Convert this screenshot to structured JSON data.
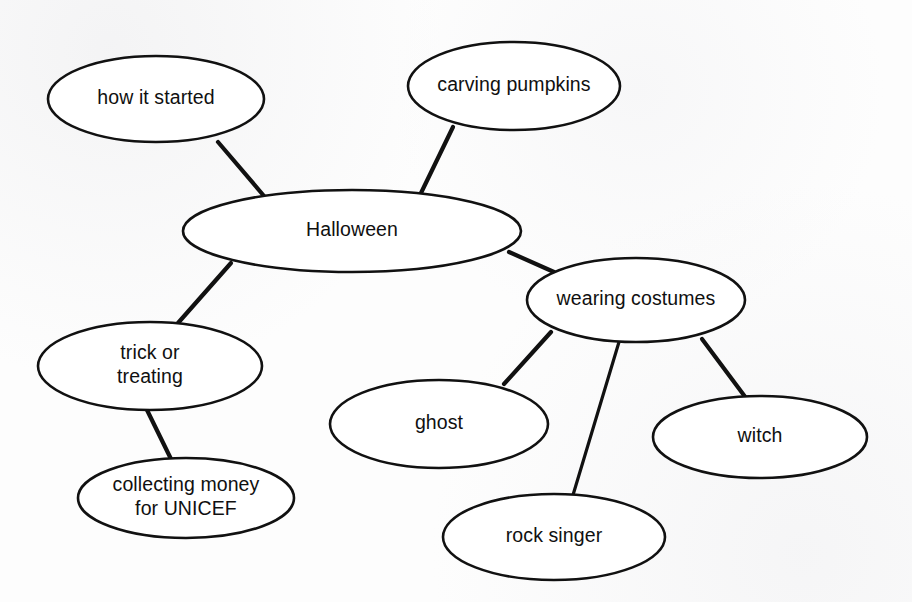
{
  "diagram": {
    "title": "Halloween",
    "type": "mind-map",
    "background_color": "#fdfdfd",
    "ink_color": "#111111",
    "nodes": [
      {
        "id": "halloween",
        "label": "Halloween",
        "lines": [
          "Halloween"
        ],
        "cx": 352,
        "cy": 231,
        "rx": 169,
        "ry": 41,
        "level": 0
      },
      {
        "id": "how-it-started",
        "label": "how it started",
        "lines": [
          "how it started"
        ],
        "cx": 156,
        "cy": 99,
        "rx": 108,
        "ry": 43,
        "level": 1
      },
      {
        "id": "carving-pumpkins",
        "label": "carving pumpkins",
        "lines": [
          "carving pumpkins"
        ],
        "cx": 514,
        "cy": 86,
        "rx": 106,
        "ry": 44,
        "level": 1
      },
      {
        "id": "trick-or-treating",
        "label": "trick or treating",
        "lines": [
          "trick or",
          "treating"
        ],
        "cx": 150,
        "cy": 366,
        "rx": 112,
        "ry": 44,
        "level": 1
      },
      {
        "id": "wearing-costumes",
        "label": "wearing costumes",
        "lines": [
          "wearing costumes"
        ],
        "cx": 636,
        "cy": 300,
        "rx": 109,
        "ry": 42,
        "level": 1
      },
      {
        "id": "collecting-money-for-unicef",
        "label": "collecting money for UNICEF",
        "lines": [
          "collecting money",
          "for UNICEF"
        ],
        "cx": 186,
        "cy": 498,
        "rx": 108,
        "ry": 40,
        "level": 2
      },
      {
        "id": "ghost",
        "label": "ghost",
        "lines": [
          "ghost"
        ],
        "cx": 439,
        "cy": 424,
        "rx": 109,
        "ry": 44,
        "level": 2
      },
      {
        "id": "rock-singer",
        "label": "rock singer",
        "lines": [
          "rock singer"
        ],
        "cx": 554,
        "cy": 537,
        "rx": 111,
        "ry": 43,
        "level": 2
      },
      {
        "id": "witch",
        "label": "witch",
        "lines": [
          "witch"
        ],
        "cx": 760,
        "cy": 437,
        "rx": 107,
        "ry": 41,
        "level": 2
      }
    ],
    "edges": [
      {
        "id": "edge-how-it-started",
        "from": "how-it-started",
        "to": "halloween",
        "x1": 218,
        "y1": 142,
        "x2": 264,
        "y2": 196
      },
      {
        "id": "edge-carving-pumpkins",
        "from": "carving-pumpkins",
        "to": "halloween",
        "x1": 453,
        "y1": 127,
        "x2": 421,
        "y2": 193
      },
      {
        "id": "edge-trick-or-treating",
        "from": "halloween",
        "to": "trick-or-treating",
        "x1": 231,
        "y1": 263,
        "x2": 178,
        "y2": 323
      },
      {
        "id": "edge-wearing-costumes",
        "from": "halloween",
        "to": "wearing-costumes",
        "x1": 509,
        "y1": 252,
        "x2": 554,
        "y2": 272
      },
      {
        "id": "edge-collecting-money",
        "from": "trick-or-treating",
        "to": "collecting-money-for-unicef",
        "x1": 147,
        "y1": 410,
        "x2": 171,
        "y2": 459
      },
      {
        "id": "edge-ghost",
        "from": "wearing-costumes",
        "to": "ghost",
        "x1": 551,
        "y1": 332,
        "x2": 504,
        "y2": 384
      },
      {
        "id": "edge-rock-singer",
        "from": "wearing-costumes",
        "to": "rock-singer",
        "x1": 619,
        "y1": 342,
        "x2": 573,
        "y2": 495
      },
      {
        "id": "edge-witch",
        "from": "wearing-costumes",
        "to": "witch",
        "x1": 702,
        "y1": 339,
        "x2": 746,
        "y2": 398
      }
    ]
  }
}
